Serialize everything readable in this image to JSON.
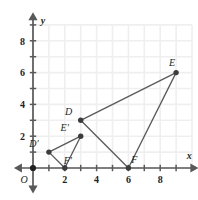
{
  "figure": {
    "kind": "coordinate-plane-diagram",
    "background_color": "#ffffff",
    "grid_color": "#efefef",
    "axis_color": "#58595b",
    "shape_color": "#58595b",
    "label_color": "#231f20",
    "origin_label": "O",
    "axis_labels": {
      "x": "x",
      "y": "y"
    },
    "x_axis": {
      "tick_labels": [
        "2",
        "4",
        "6",
        "8"
      ],
      "tick_values": [
        2,
        4,
        6,
        8
      ],
      "min": -1.2,
      "max": 10.4,
      "minor_tick_step": 1
    },
    "y_axis": {
      "tick_labels": [
        "2",
        "4",
        "6",
        "8"
      ],
      "tick_values": [
        2,
        4,
        6,
        8
      ],
      "min": -1.6,
      "max": 9.8,
      "minor_tick_step": 1
    },
    "grid": {
      "enabled": true,
      "x_lines": [
        0,
        1,
        2,
        3,
        4,
        5,
        6,
        7,
        8,
        9,
        10
      ],
      "y_lines": [
        0,
        1,
        2,
        3,
        4,
        5,
        6,
        7,
        8,
        9
      ]
    }
  },
  "shapes": [
    {
      "name": "triangle-def",
      "label": "Triangle DEF",
      "vertices": [
        {
          "name": "D",
          "label": "D",
          "x": 3,
          "y": 3,
          "label_dx": -12,
          "label_dy": -5
        },
        {
          "name": "E",
          "label": "E",
          "x": 9,
          "y": 6,
          "label_dx": -4,
          "label_dy": -7
        },
        {
          "name": "F",
          "label": "F",
          "x": 6,
          "y": 0,
          "label_dx": 6,
          "label_dy": -5
        }
      ]
    },
    {
      "name": "triangle-d-prime-e-prime-f-prime",
      "label": "Triangle D'E'F'",
      "vertices": [
        {
          "name": "D-prime",
          "label": "D′",
          "x": 1,
          "y": 1,
          "label_dx": -15,
          "label_dy": -5
        },
        {
          "name": "E-prime",
          "label": "E′",
          "x": 3,
          "y": 2,
          "label_dx": -16,
          "label_dy": -5
        },
        {
          "name": "F-prime",
          "label": "F′",
          "x": 2,
          "y": 0,
          "label_dx": 3,
          "label_dy": -4
        }
      ]
    }
  ]
}
